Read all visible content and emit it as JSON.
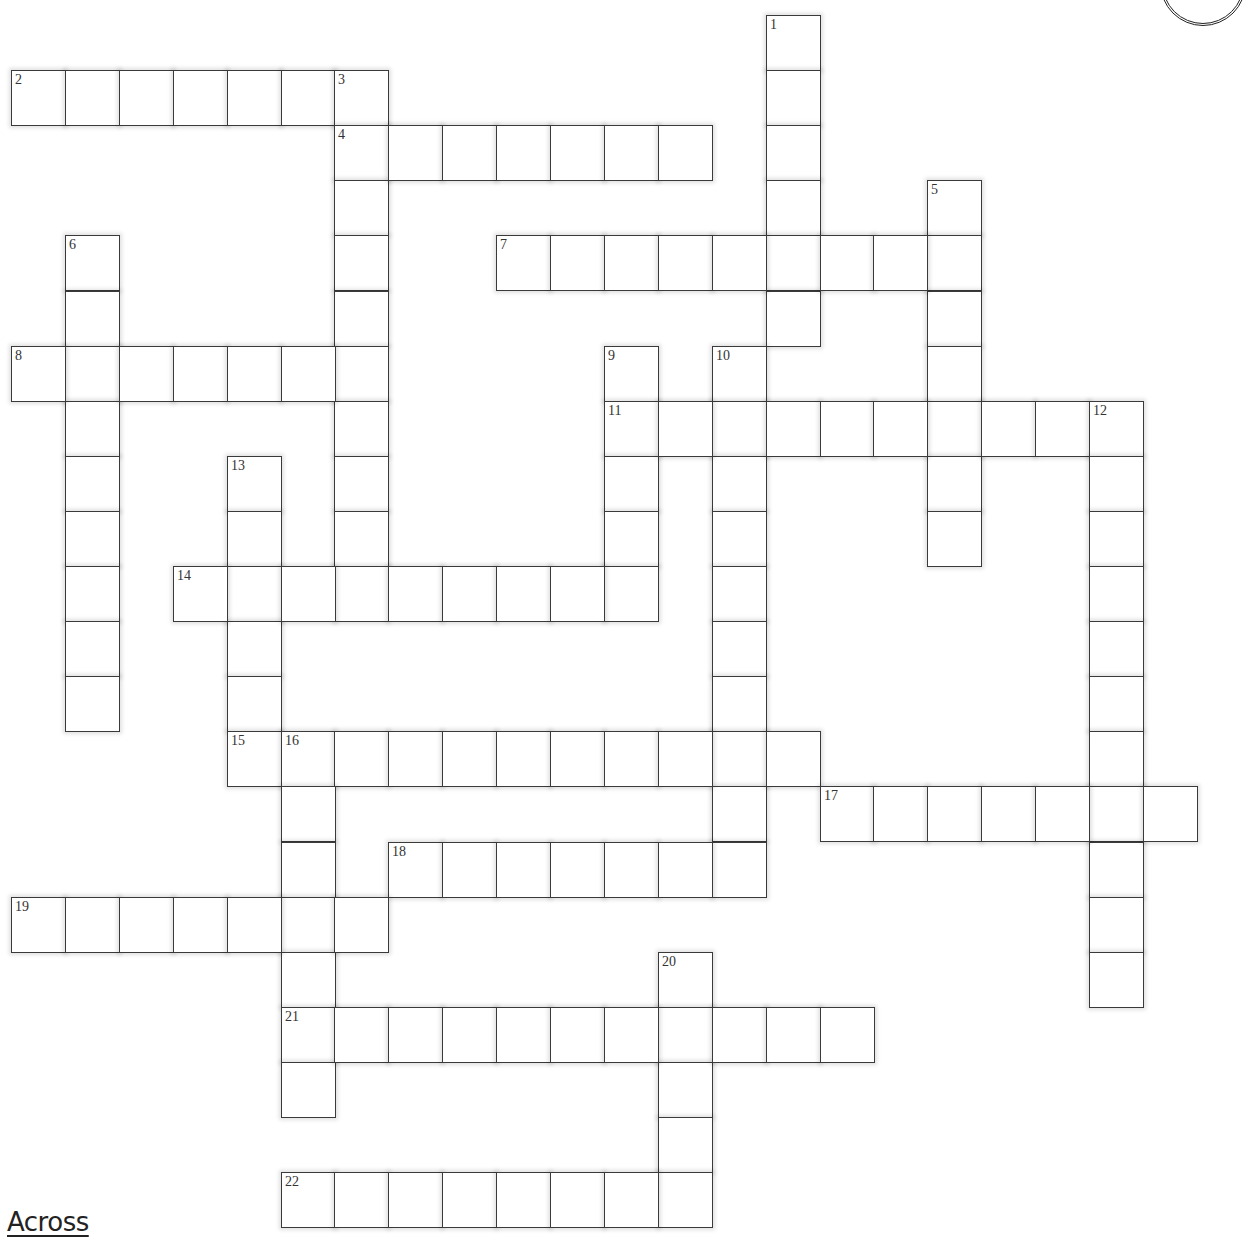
{
  "grid": {
    "origin_x": 11,
    "origin_y": 15,
    "pitch_x": 53.9,
    "pitch_y": 55.1,
    "cell_w": 55,
    "cell_h": 56
  },
  "words": [
    {
      "number": 1,
      "direction": "down",
      "col": 14,
      "row": 0,
      "length": 6
    },
    {
      "number": 2,
      "direction": "across",
      "col": 0,
      "row": 1,
      "length": 7
    },
    {
      "number": 3,
      "direction": "down",
      "col": 6,
      "row": 1,
      "length": 10
    },
    {
      "number": 4,
      "direction": "across",
      "col": 6,
      "row": 2,
      "length": 7
    },
    {
      "number": 5,
      "direction": "down",
      "col": 17,
      "row": 3,
      "length": 7
    },
    {
      "number": 6,
      "direction": "down",
      "col": 1,
      "row": 4,
      "length": 9
    },
    {
      "number": 7,
      "direction": "across",
      "col": 9,
      "row": 4,
      "length": 9
    },
    {
      "number": 8,
      "direction": "across",
      "col": 0,
      "row": 6,
      "length": 7
    },
    {
      "number": 9,
      "direction": "down",
      "col": 11,
      "row": 6,
      "length": 5
    },
    {
      "number": 10,
      "direction": "down",
      "col": 13,
      "row": 6,
      "length": 10
    },
    {
      "number": 11,
      "direction": "across",
      "col": 11,
      "row": 7,
      "length": 10
    },
    {
      "number": 12,
      "direction": "down",
      "col": 20,
      "row": 7,
      "length": 11
    },
    {
      "number": 13,
      "direction": "down",
      "col": 4,
      "row": 8,
      "length": 6
    },
    {
      "number": 14,
      "direction": "across",
      "col": 3,
      "row": 10,
      "length": 9
    },
    {
      "number": 15,
      "direction": "across",
      "col": 4,
      "row": 13,
      "length": 11
    },
    {
      "number": 16,
      "direction": "down",
      "col": 5,
      "row": 13,
      "length": 7
    },
    {
      "number": 17,
      "direction": "across",
      "col": 15,
      "row": 14,
      "length": 7
    },
    {
      "number": 18,
      "direction": "across",
      "col": 7,
      "row": 15,
      "length": 7
    },
    {
      "number": 19,
      "direction": "across",
      "col": 0,
      "row": 16,
      "length": 7
    },
    {
      "number": 20,
      "direction": "down",
      "col": 12,
      "row": 17,
      "length": 5
    },
    {
      "number": 21,
      "direction": "across",
      "col": 5,
      "row": 18,
      "length": 11
    },
    {
      "number": 22,
      "direction": "across",
      "col": 5,
      "row": 21,
      "length": 8
    }
  ],
  "clues": {
    "across_heading": "Across"
  }
}
